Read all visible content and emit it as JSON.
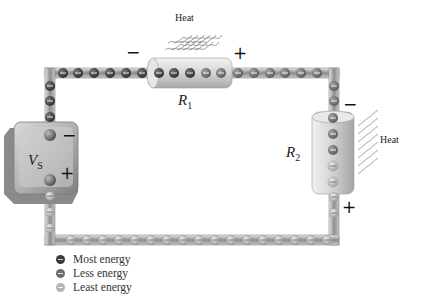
{
  "diagram": {
    "source": {
      "label": "V",
      "subscript": "S",
      "neg_terminal": "−",
      "pos_terminal": "+"
    },
    "resistors": [
      {
        "id": "R1",
        "label": "R",
        "subscript": "1",
        "neg_terminal": "−",
        "pos_terminal": "+",
        "heat_label": "Heat"
      },
      {
        "id": "R2",
        "label": "R",
        "subscript": "2",
        "neg_terminal": "−",
        "pos_terminal": "+",
        "heat_label": "Heat"
      }
    ],
    "electron_symbol": "−",
    "legend": [
      {
        "label": "Most energy",
        "color": "#3a3a3a"
      },
      {
        "label": "Less energy",
        "color": "#6e6e6e"
      },
      {
        "label": "Least energy",
        "color": "#b4b4b4"
      }
    ],
    "colors": {
      "wire": "#9a9a9a",
      "resistor_body": "#d6d6d6",
      "battery_body": "#a8a8a8",
      "most_energy": "#3a3a3a",
      "less_energy": "#6e6e6e",
      "least_energy": "#b4b4b4"
    }
  }
}
